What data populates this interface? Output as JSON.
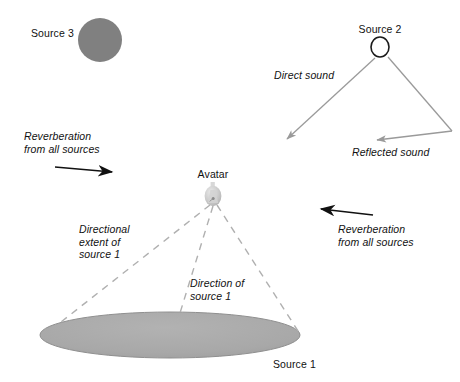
{
  "diagram": {
    "background_color": "#ffffff",
    "colors": {
      "source3_fill": "#808080",
      "source1_fill": "#a6a6a6",
      "source1_edge": "#8c8c8c",
      "source2_stroke": "#1a1a1a",
      "dashed_line": "#b0b0b0",
      "sound_ray": "#9a9a9a",
      "reverb_arrow": "#111111",
      "avatar_body": "#c9c9c9",
      "text": "#111111"
    },
    "labels": {
      "source_3": "Source 3",
      "source_2": "Source 2",
      "source_1": "Source 1",
      "avatar": "Avatar",
      "direct_sound": "Direct sound",
      "reflected_sound": "Reflected sound",
      "reverberation_left": "Reverberation\nfrom all sources",
      "reverberation_right": "Reverberation\nfrom all sources",
      "directional_extent": "Directional\nextent of\nsource 1",
      "direction_of": "Direction of\nsource 1"
    },
    "elements": {
      "source_3": {
        "shape": "filled-circle",
        "cx": 100,
        "cy": 40,
        "r": 22
      },
      "source_2": {
        "shape": "open-circle",
        "cx": 380,
        "cy": 47,
        "rx": 9,
        "ry": 10
      },
      "source_1": {
        "shape": "filled-ellipse",
        "cx": 170,
        "cy": 335,
        "rx": 130,
        "ry": 23
      },
      "avatar": {
        "shape": "avatar-figure",
        "cx": 213,
        "cy": 196
      }
    },
    "rays": {
      "direct_sound": {
        "from": [
          375,
          58
        ],
        "to": [
          283,
          143
        ]
      },
      "reflected_sound_in": {
        "from": [
          388,
          57
        ],
        "to": [
          452,
          131
        ]
      },
      "reflected_sound_out": {
        "from": [
          452,
          131
        ],
        "to": [
          372,
          141
        ]
      }
    },
    "reverb_arrows": {
      "left": {
        "from": [
          55,
          167
        ],
        "to": [
          118,
          173
        ],
        "direction": "right"
      },
      "right": {
        "from": [
          373,
          215
        ],
        "to": [
          315,
          208
        ],
        "direction": "left"
      }
    },
    "cone_lines": {
      "extent_left": {
        "from": [
          211,
          204
        ],
        "to": [
          61,
          322
        ]
      },
      "direction_center": {
        "from": [
          213,
          205
        ],
        "to": [
          176,
          326
        ]
      },
      "extent_right": {
        "from": [
          217,
          204
        ],
        "to": [
          300,
          334
        ]
      }
    }
  }
}
